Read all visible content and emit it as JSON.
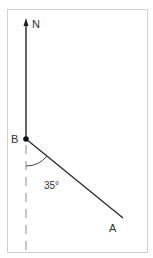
{
  "diagram": {
    "labels": {
      "north": "N",
      "point_b": "B",
      "point_a": "A",
      "angle": "35°"
    },
    "angle_degrees": 35,
    "colors": {
      "frame": "#d0d0d0",
      "line": "#222222",
      "dashed": "#999999",
      "text": "#333333"
    }
  }
}
